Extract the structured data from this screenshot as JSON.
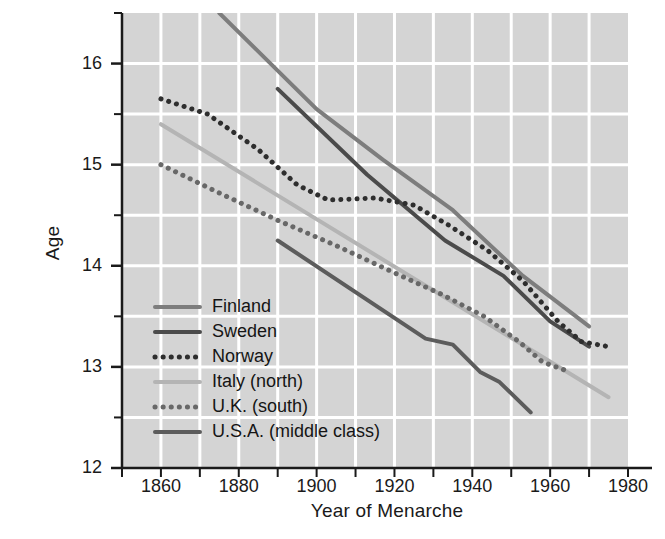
{
  "chart_data": {
    "type": "line",
    "title": "",
    "xlabel": "Year of Menarche",
    "ylabel": "Age",
    "xlim": [
      1850,
      1980
    ],
    "ylim": [
      12,
      16.5
    ],
    "xticks": [
      1860,
      1880,
      1900,
      1920,
      1940,
      1960,
      1980
    ],
    "xticklabels": [
      "1860",
      "1880",
      "1900",
      "1920",
      "1940",
      "1960",
      "1980"
    ],
    "xminorticks": [
      1850,
      1870,
      1890,
      1910,
      1930,
      1950,
      1970
    ],
    "yticks": [
      12,
      13,
      14,
      15,
      16
    ],
    "yticklabels": [
      "12",
      "13",
      "14",
      "15",
      "16"
    ],
    "yminorticks": [
      12.5,
      13.5,
      14.5,
      15.5,
      16.5
    ],
    "grid": true,
    "grid_color": "#ffffff",
    "plot_background": "#d4d4d4",
    "legend_position": "lower-left-inside",
    "series": [
      {
        "name": "Finland",
        "color": "#7d7d7d",
        "style": "solid",
        "width": 4,
        "x": [
          1875,
          1900,
          1917,
          1935,
          1953,
          1970
        ],
        "y": [
          16.5,
          15.55,
          15.05,
          14.55,
          13.9,
          13.4
        ]
      },
      {
        "name": "Sweden",
        "color": "#4b4b4b",
        "style": "solid",
        "width": 4,
        "x": [
          1890,
          1913,
          1933,
          1948,
          1960,
          1970
        ],
        "y": [
          15.75,
          14.9,
          14.25,
          13.9,
          13.45,
          13.2
        ]
      },
      {
        "name": "Norway",
        "color": "#2e2e2e",
        "style": "dotted",
        "width": 5,
        "x": [
          1860,
          1872,
          1885,
          1895,
          1903,
          1915,
          1925,
          1934,
          1944,
          1953,
          1962,
          1968,
          1975
        ],
        "y": [
          15.65,
          15.5,
          15.15,
          14.8,
          14.65,
          14.67,
          14.6,
          14.4,
          14.15,
          13.85,
          13.45,
          13.25,
          13.2
        ]
      },
      {
        "name": "Italy (north)",
        "color": "#b4b4b4",
        "style": "solid",
        "width": 4,
        "x": [
          1860,
          1975
        ],
        "y": [
          15.4,
          12.7
        ]
      },
      {
        "name": "U.K. (south)",
        "color": "#686868",
        "style": "dotted",
        "width": 5,
        "x": [
          1860,
          1875,
          1890,
          1905,
          1920,
          1932,
          1943,
          1952,
          1958,
          1965
        ],
        "y": [
          15.0,
          14.72,
          14.45,
          14.2,
          13.93,
          13.72,
          13.5,
          13.25,
          13.05,
          12.95
        ]
      },
      {
        "name": "U.S.A. (middle class)",
        "color": "#5c5c5c",
        "style": "solid",
        "width": 4,
        "x": [
          1890,
          1928,
          1935,
          1942,
          1947,
          1955
        ],
        "y": [
          14.25,
          13.28,
          13.22,
          12.95,
          12.85,
          12.55
        ]
      }
    ]
  },
  "legend": {
    "items": [
      {
        "label": "Finland"
      },
      {
        "label": "Sweden"
      },
      {
        "label": "Norway"
      },
      {
        "label": "Italy (north)"
      },
      {
        "label": "U.K. (south)"
      },
      {
        "label": "U.S.A. (middle class)"
      }
    ]
  }
}
